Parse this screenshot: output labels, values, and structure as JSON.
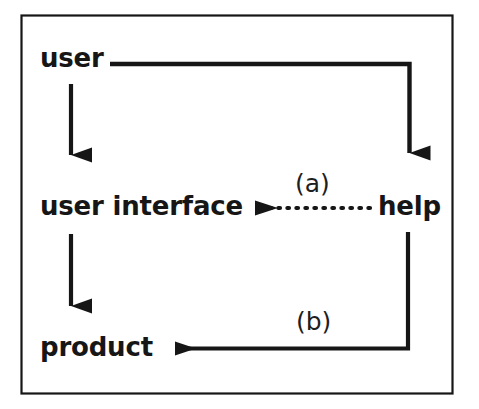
{
  "figure": {
    "type": "flow-diagram",
    "caption": "",
    "background_color": "#ffffff",
    "stroke_color": "#161616",
    "border": {
      "present": true,
      "style": "solid-thin-rectangle",
      "color": "#161616"
    }
  },
  "nodes": [
    {
      "id": "user",
      "label": "user"
    },
    {
      "id": "user-interface",
      "label": "user interface"
    },
    {
      "id": "help",
      "label": "help"
    },
    {
      "id": "product",
      "label": "product"
    }
  ],
  "edges": [
    {
      "id": "user-to-help",
      "from": "user",
      "to": "help",
      "style": "solid",
      "label": "",
      "arrowhead": "down",
      "routing": "elbow-right-then-down"
    },
    {
      "id": "user-to-user-interface",
      "from": "user",
      "to": "user-interface",
      "style": "solid",
      "label": "",
      "arrowhead": "down",
      "routing": "straight-down"
    },
    {
      "id": "help-to-user-interface",
      "from": "help",
      "to": "user-interface",
      "style": "dotted",
      "label": "(a)",
      "arrowhead": "left",
      "routing": "straight-left"
    },
    {
      "id": "user-interface-to-product",
      "from": "user-interface",
      "to": "product",
      "style": "solid",
      "label": "",
      "arrowhead": "down",
      "routing": "straight-down"
    },
    {
      "id": "help-to-product",
      "from": "help",
      "to": "product",
      "style": "solid",
      "label": "(b)",
      "arrowhead": "left",
      "routing": "elbow-down-then-left"
    }
  ],
  "edge_labels": {
    "a": "(a)",
    "b": "(b)"
  }
}
